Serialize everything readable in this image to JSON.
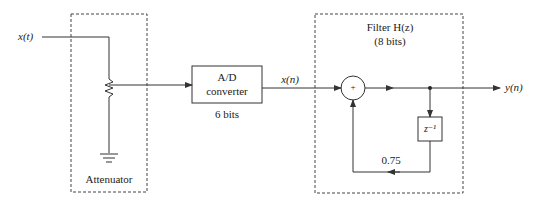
{
  "diagram": {
    "type": "block-diagram",
    "signals": {
      "input": "x(t)",
      "sampled": "x(n)",
      "output": "y(n)"
    },
    "blocks": {
      "attenuator": {
        "label": "Attenuator"
      },
      "adc": {
        "line1": "A/D",
        "line2": "converter",
        "bits": "6 bits"
      },
      "filter": {
        "title": "Filter H(z)",
        "bits": "(8 bits)"
      },
      "adder": {
        "symbol": "+"
      },
      "delay": {
        "label": "z⁻¹"
      },
      "feedback_gain": {
        "label": "0.75"
      }
    },
    "colors": {
      "line": "#333333",
      "dashed": "#444444",
      "background": "#ffffff"
    }
  }
}
